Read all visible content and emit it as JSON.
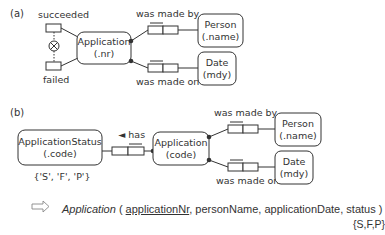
{
  "part_a": {
    "label": "(a)",
    "entity": {
      "name": "Application",
      "refmode": "(.nr)"
    },
    "subtypes": {
      "top": "succeeded",
      "bottom": "failed",
      "constraint": "exclusion"
    },
    "fact_top": {
      "reading": "was made by",
      "target_name": "Person",
      "target_refmode": "(.name)"
    },
    "fact_bottom": {
      "reading": "was made on",
      "target_name": "Date",
      "target_refmode": "(mdy)"
    }
  },
  "part_b": {
    "label": "(b)",
    "status_entity": {
      "name": "ApplicationStatus",
      "refmode": "(.code)",
      "values": "{'S', 'F', 'P'}"
    },
    "has_reading": "◄ has",
    "entity": {
      "name": "Application",
      "refmode": "(code)"
    },
    "fact_top": {
      "reading": "was made by",
      "target_name": "Person",
      "target_refmode": "(.name)"
    },
    "fact_bottom": {
      "reading": "was made on",
      "target_name": "Date",
      "target_refmode": "(mdy)"
    }
  },
  "mapping": {
    "arrow": "⇨",
    "table_name": "Application",
    "open": " ( ",
    "key": "applicationNr",
    "rest": ", personName, applicationDate, status )",
    "enum": "{S,F,P}"
  }
}
